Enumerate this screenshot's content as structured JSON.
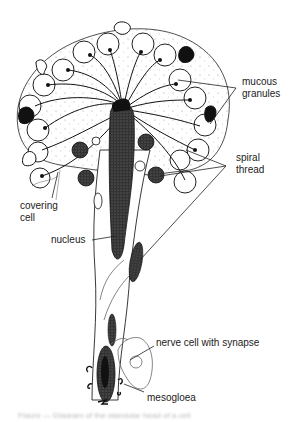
{
  "figure": {
    "type": "labeled scientific line drawing",
    "colors": {
      "ink": "#111111",
      "stipple": "#777777",
      "paper": "#ffffff",
      "label_text": "#222222"
    }
  },
  "labels": {
    "mucous_granules_line1": "mucous",
    "mucous_granules_line2": "granules",
    "spiral_thread_line1": "spiral",
    "spiral_thread_line2": "thread",
    "covering_cell_line1": "covering",
    "covering_cell_line2": "cell",
    "nucleus": "nucleus",
    "nerve_cell": "nerve cell with synapse",
    "mesogloea": "mesogloea"
  },
  "caption": {
    "text": "Figure — Diagram of the glandular head of a cell"
  }
}
